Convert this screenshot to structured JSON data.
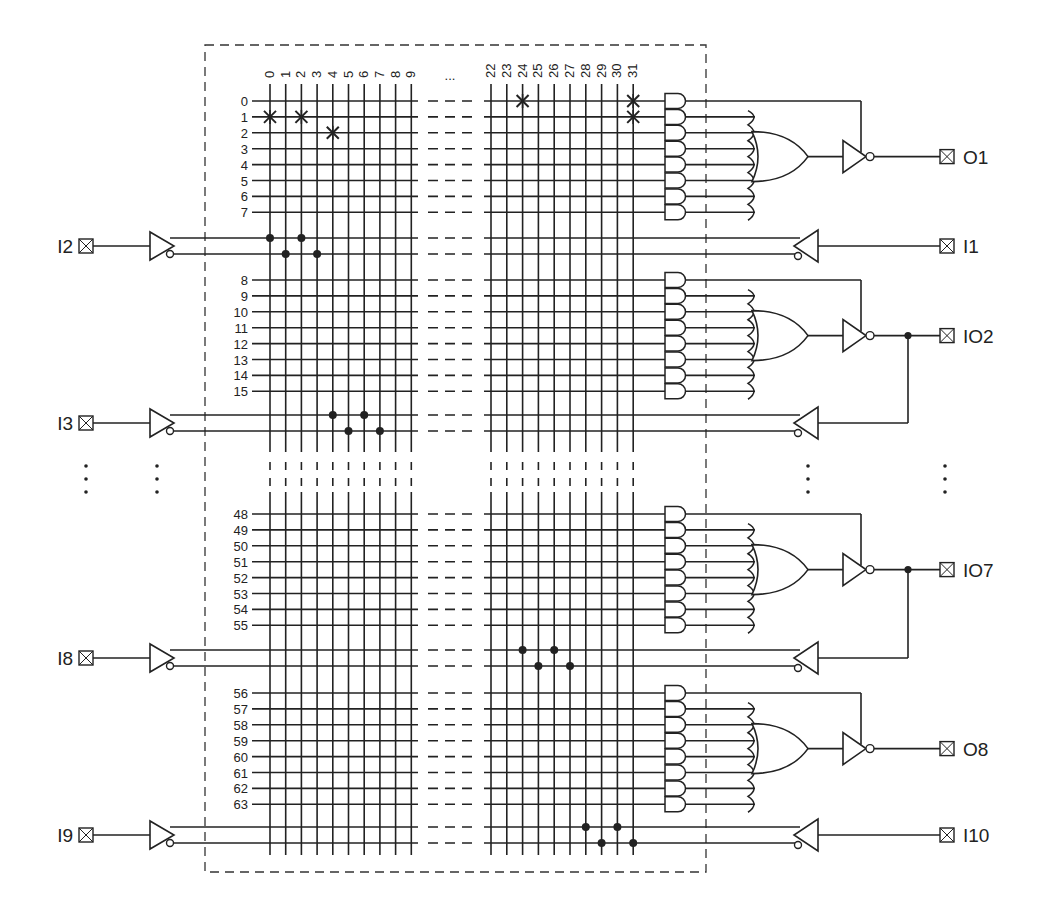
{
  "diagram": {
    "colors": {
      "ink": "#222222",
      "background": "#ffffff",
      "dashed_box": "#333333"
    },
    "column_labels": [
      "0",
      "1",
      "2",
      "3",
      "4",
      "5",
      "6",
      "7",
      "8",
      "9",
      "22",
      "23",
      "24",
      "25",
      "26",
      "27",
      "28",
      "29",
      "30",
      "31"
    ],
    "column_ellipsis": "...",
    "row_groups": [
      {
        "labels": [
          "0",
          "1",
          "2",
          "3",
          "4",
          "5",
          "6",
          "7"
        ],
        "output": "O1",
        "output_type": "output"
      },
      {
        "labels": [
          "8",
          "9",
          "10",
          "11",
          "12",
          "13",
          "14",
          "15"
        ],
        "output": "IO2",
        "output_type": "io"
      },
      {
        "labels": [
          "48",
          "49",
          "50",
          "51",
          "52",
          "53",
          "54",
          "55"
        ],
        "output": "IO7",
        "output_type": "io"
      },
      {
        "labels": [
          "56",
          "57",
          "58",
          "59",
          "60",
          "61",
          "62",
          "63"
        ],
        "output": "O8",
        "output_type": "output"
      }
    ],
    "left_inputs": [
      "I2",
      "I3",
      "I8",
      "I9"
    ],
    "right_inputs": [
      "I1",
      "",
      "",
      "I10"
    ],
    "ellipsis_vertical": "⋮",
    "fuses": [
      {
        "row": "0",
        "col": "24"
      },
      {
        "row": "0",
        "col": "31"
      },
      {
        "row": "1",
        "col": "0"
      },
      {
        "row": "1",
        "col": "2"
      },
      {
        "row": "1",
        "col": "31"
      },
      {
        "row": "2",
        "col": "4"
      }
    ],
    "pin_symbol": "⊠"
  }
}
